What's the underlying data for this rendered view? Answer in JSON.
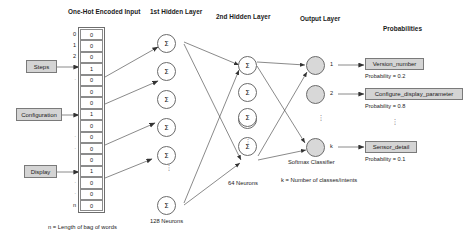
{
  "diagram": {
    "headers": {
      "input": "One-Hot Encoded Input",
      "hidden1": "1st Hidden Layer",
      "hidden2": "2nd Hidden Layer",
      "output": "Output Layer",
      "probabilities": "Probabilities"
    },
    "captions": {
      "input_note": "n = Length of bag of words",
      "hidden1_note": "128 Neurons",
      "hidden2_note": "64 Neurons",
      "softmax_note": "Softmax Classifier",
      "k_note": "k = Number of classes/intents"
    },
    "word_tags": [
      {
        "label": "Steps"
      },
      {
        "label": "Configuration"
      },
      {
        "label": "Display"
      }
    ],
    "input_vector": {
      "index_labels": [
        "0",
        "1",
        "2",
        "",
        "",
        "",
        "",
        "",
        "",
        "",
        "",
        "",
        "",
        "",
        "",
        "n"
      ],
      "values": [
        "0",
        "0",
        "0",
        "1",
        "0",
        "0",
        "0",
        "1",
        "0",
        "0",
        "0",
        "0",
        "1",
        "0",
        "0",
        "0"
      ],
      "ellipsis_rows": [
        4,
        9,
        10,
        13,
        14
      ]
    },
    "hidden1": {
      "neuron_symbol": "Σ",
      "visible_count": 6
    },
    "hidden2": {
      "neuron_symbol": "Σ",
      "visible_count": 5
    },
    "output_nodes": [
      {
        "index_label": "1"
      },
      {
        "index_label": "2"
      },
      {
        "index_label": "k"
      }
    ],
    "predictions": [
      {
        "intent": "Version_number",
        "probability_text": "Probability = 0.2",
        "probability": 0.2
      },
      {
        "intent": "Configure_display_parameter",
        "probability_text": "Probability = 0.8",
        "probability": 0.8
      },
      {
        "intent": "Sensor_detail",
        "probability_text": "Probability = 0.1",
        "probability": 0.1
      }
    ],
    "colors": {
      "tag_fill": "#d4d4d4",
      "tag_stroke": "#7a7a7a",
      "node_fill": "#d8d8d8",
      "stroke": "#6b6b6b",
      "background": "#ffffff"
    }
  }
}
